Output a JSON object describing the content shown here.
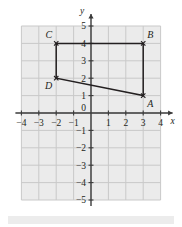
{
  "figure": {
    "name": "coordinate-plane-quadrilateral",
    "background_color": "#ffffff",
    "plot_background_color": "#ebebeb",
    "grid_color": "#c9c9c9",
    "axis_color": "#3a3a3a",
    "shape_color": "#231f20",
    "bottom_bar_color": "#ececec"
  },
  "axes": {
    "x_axis_label": "x",
    "y_axis_label": "y",
    "origin_label": "0",
    "x_min": -4,
    "x_max": 4,
    "y_min": -5,
    "y_max": 5,
    "x_tick_labels": [
      "-4",
      "-3",
      "-2",
      "-1",
      "1",
      "2",
      "3",
      "4"
    ],
    "y_tick_labels": [
      "5",
      "4",
      "3",
      "2",
      "1",
      "-1",
      "-2",
      "-3",
      "-4",
      "-5"
    ],
    "x_ticks": [
      -4,
      -3,
      -2,
      -1,
      1,
      2,
      3,
      4
    ],
    "y_ticks": [
      5,
      4,
      3,
      2,
      1,
      -1,
      -2,
      -3,
      -4,
      -5
    ],
    "grid": true,
    "arrowheads": [
      "x-positive",
      "y-positive"
    ]
  },
  "chart_data": {
    "type": "scatter",
    "title": "",
    "xlabel": "x",
    "ylabel": "y",
    "xlim": [
      -4,
      4
    ],
    "ylim": [
      -5,
      5
    ],
    "grid": true,
    "shape": "quadrilateral",
    "closed": true,
    "vertices": [
      {
        "label": "A",
        "x": 3,
        "y": 1,
        "label_position": "below-right"
      },
      {
        "label": "B",
        "x": 3,
        "y": 4,
        "label_position": "above-right"
      },
      {
        "label": "C",
        "x": -2,
        "y": 4,
        "label_position": "above-left"
      },
      {
        "label": "D",
        "x": -2,
        "y": 2,
        "label_position": "below-left"
      }
    ],
    "edges": [
      {
        "from": "A",
        "to": "B"
      },
      {
        "from": "B",
        "to": "C"
      },
      {
        "from": "C",
        "to": "D"
      },
      {
        "from": "D",
        "to": "A"
      }
    ]
  }
}
